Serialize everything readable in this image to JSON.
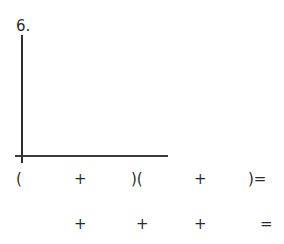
{
  "problem": {
    "number": "6."
  },
  "graph": {
    "type": "blank axes"
  },
  "row1": [
    {
      "text": "(",
      "x": 16
    },
    {
      "text": "+",
      "x": 74
    },
    {
      "text": ")(",
      "x": 131
    },
    {
      "text": "+",
      "x": 194
    },
    {
      "text": ")=",
      "x": 248
    }
  ],
  "row2": [
    {
      "text": "+",
      "x": 74
    },
    {
      "text": "+",
      "x": 136
    },
    {
      "text": "+",
      "x": 194
    },
    {
      "text": "=",
      "x": 260
    }
  ]
}
